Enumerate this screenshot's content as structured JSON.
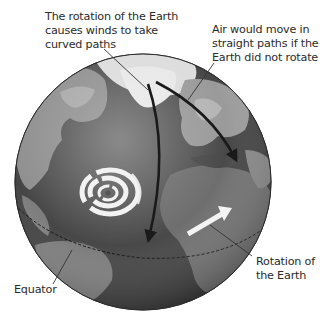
{
  "diagram": {
    "labels": {
      "curved": {
        "lines": [
          "The rotation of the Earth",
          "causes winds to take",
          "curved paths"
        ]
      },
      "straight": {
        "lines": [
          "Air would move in",
          "straight paths if the",
          "Earth did not rotate"
        ]
      },
      "rotation": {
        "lines": [
          "Rotation of",
          "the Earth"
        ]
      },
      "equator": {
        "lines": [
          "Equator"
        ]
      }
    },
    "elements": {
      "globe": "grayscale Earth centered on Atlantic Ocean",
      "curved_path_arrow": "dark curved arrow from Arctic toward equator",
      "straight_path_arrow": "dark straight arrow from Arctic toward Middle East",
      "rotation_arrow": "white arrow pointing east",
      "hurricane": "white spiral storm over Atlantic",
      "equator_line": "dashed line across globe"
    },
    "colors": {
      "ocean": "#4a4a4a",
      "land": "#8c8c8c",
      "ice": "#e6e6e6",
      "arrow": "#1a1a1a",
      "leader": "#333333",
      "text": "#2b2b2b"
    }
  }
}
